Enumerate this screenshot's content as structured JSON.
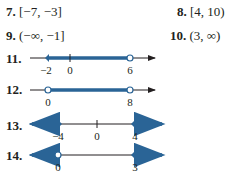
{
  "answers": [
    {
      "num": "7.",
      "text": "[−7, −3]"
    },
    {
      "num": "8.",
      "text": "[4, 10)"
    },
    {
      "num": "9.",
      "text": "(−∞, −1]"
    },
    {
      "num": "10.",
      "text": "(3, ∞)"
    }
  ],
  "number_lines": [
    {
      "num": "11.",
      "labels": [
        "−2",
        "0",
        "6"
      ]
    },
    {
      "num": "12.",
      "labels": [
        "0",
        "8"
      ]
    },
    {
      "num": "13.",
      "labels": [
        "−4",
        "0",
        "4"
      ]
    },
    {
      "num": "14.",
      "labels": [
        "0",
        "3"
      ]
    }
  ],
  "colors": {
    "shade": "#2a6496",
    "axis": "#231f20"
  }
}
